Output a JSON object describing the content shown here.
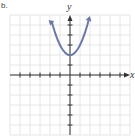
{
  "corner_label": "b.",
  "colors": {
    "curve": "#6a78a8",
    "grid": "#e6e6e6",
    "axis": "#333333"
  },
  "chart_data": {
    "type": "line",
    "title": "",
    "xlabel": "x",
    "ylabel": "y",
    "function": "y = x^2 + 2",
    "xlim": [
      -6,
      6
    ],
    "ylim": [
      -6,
      6
    ],
    "grid": true,
    "x_ticks": [
      -5,
      -4,
      -3,
      -2,
      -1,
      1,
      2,
      3,
      4,
      5
    ],
    "y_ticks": [
      -5,
      -4,
      -3,
      -2,
      -1,
      1,
      2,
      3,
      4,
      5
    ],
    "series": [
      {
        "name": "parabola",
        "x": [
          -2,
          -1.5,
          -1,
          -0.5,
          0,
          0.5,
          1,
          1.5,
          2
        ],
        "y": [
          6,
          4.25,
          3,
          2.25,
          2,
          2.25,
          3,
          4.25,
          6
        ]
      }
    ],
    "vertex": [
      0,
      2
    ],
    "arrows": "both ends"
  }
}
